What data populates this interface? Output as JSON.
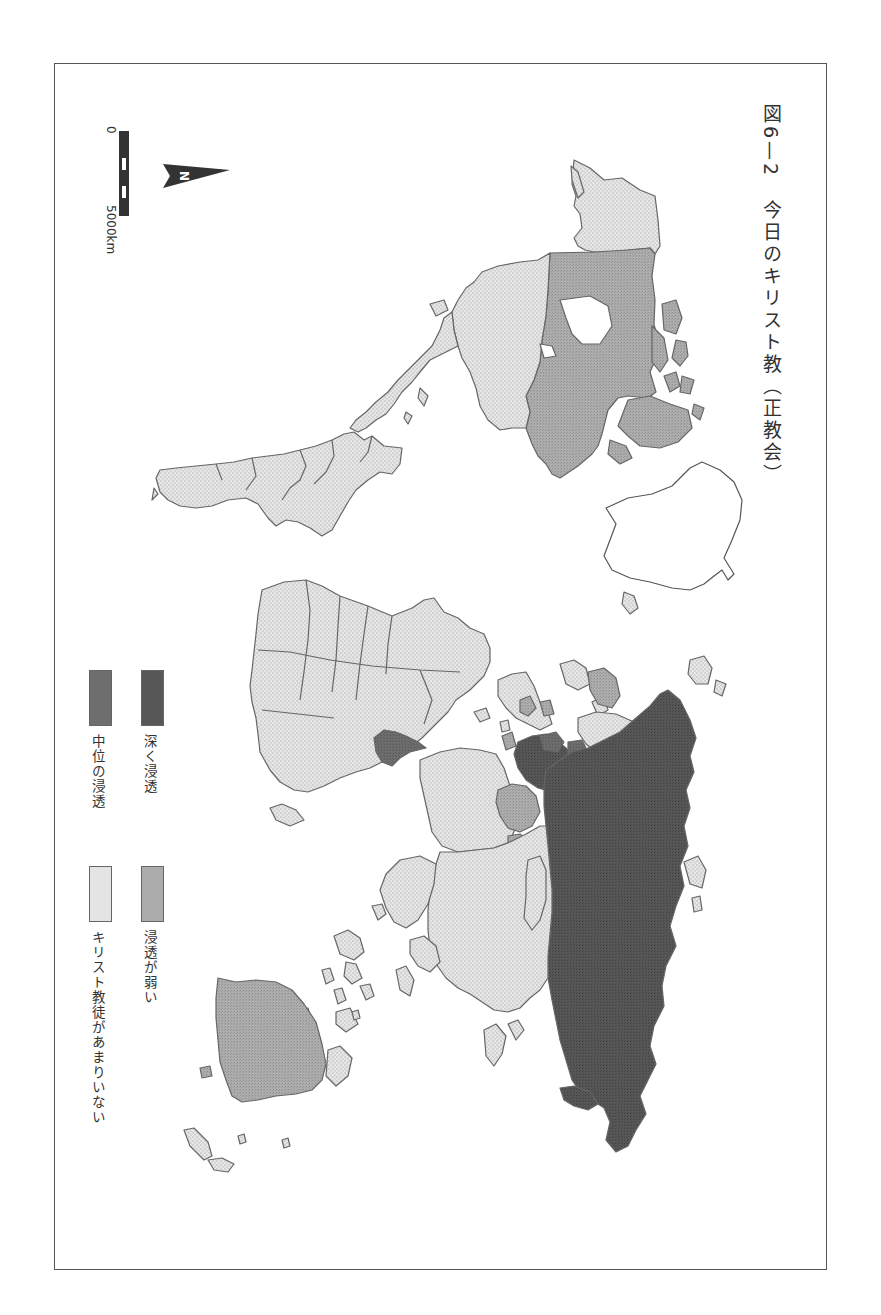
{
  "figure": {
    "title": "図6—2　今日のキリスト教（正教会）",
    "orientation": "rotated 90° clockwise (north points right)"
  },
  "legend": {
    "items": [
      {
        "label": "深く浸透",
        "fill": "#5a5a5a",
        "category": "deep"
      },
      {
        "label": "浸透が弱い",
        "fill": "#a9a9a9",
        "category": "weak"
      },
      {
        "label": "中位の浸透",
        "fill": "#6f6f6f",
        "category": "medium"
      },
      {
        "label": "キリスト教徒があまりいない",
        "fill": "#e4e4e4",
        "category": "few"
      }
    ]
  },
  "north_arrow": {
    "label": "N"
  },
  "scale_bar": {
    "start_label": "0",
    "end_label": "5000km"
  },
  "colors": {
    "deep": "#555555",
    "medium": "#6e6e6e",
    "weak": "#a6a6a6",
    "few": "#e2e2e2",
    "outline": "#6a6a6a",
    "frame": "#555555"
  },
  "regions": {
    "north_america": {
      "canada": "weak",
      "usa": "few",
      "alaska": "few",
      "greenland": "none"
    },
    "south_america": "few",
    "africa": {
      "general": "few",
      "ethiopia": "medium"
    },
    "europe": {
      "russia": "deep",
      "greece_balkans": "deep",
      "eastern_europe": "deep",
      "scandinavia_west": "few",
      "finland_baltic": "weak"
    },
    "asia": {
      "russia_siberia": "deep",
      "central_asia": "weak",
      "china_south_asia": "few",
      "middle_east": "few"
    },
    "oceania": {
      "australia": "weak",
      "new_zealand": "few",
      "islands": "few"
    }
  }
}
